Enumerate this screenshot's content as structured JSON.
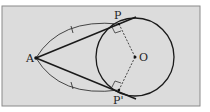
{
  "diagram": {
    "title": "",
    "background": "#dcdcdc",
    "frame_color": "#8a8a8a",
    "stroke_color": "#1a1a1a",
    "points": {
      "A": {
        "label": "A"
      },
      "P": {
        "label": "P"
      },
      "P_prime": {
        "label": "P'"
      },
      "O": {
        "label": "O"
      }
    },
    "elements": [
      "circle centered at O",
      "tangent line from A through P",
      "tangent line from A through P'",
      "dashed radius O-P",
      "dashed radius O-P'",
      "right-angle marks at P and P'",
      "arc A to P with tick mark",
      "arc A to P' with tick mark"
    ]
  }
}
